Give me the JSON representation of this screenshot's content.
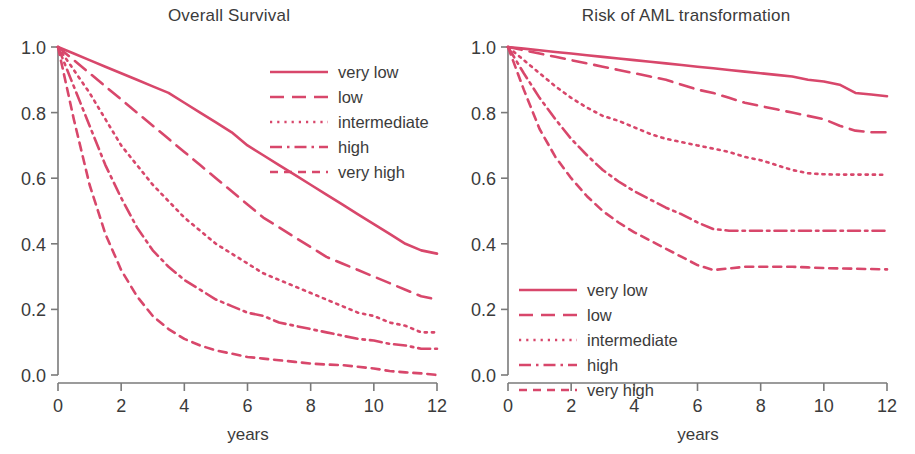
{
  "figure": {
    "width": 915,
    "height": 454,
    "background": "#ffffff",
    "line_color": "#d8476b",
    "axis_color": "#7a7a7a",
    "text_color": "#3b3b3b"
  },
  "panels": [
    {
      "id": "overall-survival",
      "title": "Overall Survival",
      "xlabel": "years",
      "ylabel": ""
    },
    {
      "id": "risk-aml-transformation",
      "title": "Risk of AML transformation",
      "xlabel": "years",
      "ylabel": ""
    }
  ],
  "axes": {
    "x_ticks": [
      "0",
      "2",
      "4",
      "6",
      "8",
      "10",
      "12"
    ],
    "y_ticks": [
      "0.0",
      "0.2",
      "0.4",
      "0.6",
      "0.8",
      "1.0"
    ],
    "xlim": [
      0,
      12
    ],
    "ylim": [
      0,
      1
    ]
  },
  "legend": {
    "entries": [
      {
        "label": "very low",
        "style": "solid"
      },
      {
        "label": "low",
        "style": "dashed"
      },
      {
        "label": "intermediate",
        "style": "dotted"
      },
      {
        "label": "high",
        "style": "dashdot"
      },
      {
        "label": "very high",
        "style": "shortdash"
      }
    ]
  },
  "chart_data": [
    {
      "type": "line",
      "title": "Overall Survival",
      "xlabel": "years",
      "ylabel": "",
      "xlim": [
        0,
        12
      ],
      "ylim": [
        0,
        1
      ],
      "grid": false,
      "legend_position": "top-right",
      "x": [
        0,
        0.5,
        1,
        1.5,
        2,
        2.5,
        3,
        3.5,
        4,
        4.5,
        5,
        5.5,
        6,
        6.5,
        7,
        7.5,
        8,
        8.5,
        9,
        9.5,
        10,
        10.5,
        11,
        11.5,
        12
      ],
      "series": [
        {
          "name": "very low",
          "style": "solid",
          "values": [
            1.0,
            0.98,
            0.96,
            0.94,
            0.92,
            0.9,
            0.88,
            0.86,
            0.83,
            0.8,
            0.77,
            0.74,
            0.7,
            0.67,
            0.64,
            0.61,
            0.58,
            0.55,
            0.52,
            0.49,
            0.46,
            0.43,
            0.4,
            0.38,
            0.37
          ]
        },
        {
          "name": "low",
          "style": "dashed",
          "values": [
            1.0,
            0.96,
            0.92,
            0.88,
            0.84,
            0.8,
            0.76,
            0.72,
            0.68,
            0.64,
            0.6,
            0.56,
            0.52,
            0.48,
            0.45,
            0.42,
            0.39,
            0.36,
            0.34,
            0.32,
            0.3,
            0.28,
            0.26,
            0.24,
            0.23
          ]
        },
        {
          "name": "intermediate",
          "style": "dotted",
          "values": [
            1.0,
            0.93,
            0.86,
            0.78,
            0.7,
            0.64,
            0.58,
            0.53,
            0.48,
            0.44,
            0.4,
            0.37,
            0.34,
            0.31,
            0.29,
            0.27,
            0.25,
            0.23,
            0.21,
            0.19,
            0.18,
            0.16,
            0.15,
            0.13,
            0.13
          ]
        },
        {
          "name": "high",
          "style": "dashdot",
          "values": [
            1.0,
            0.88,
            0.76,
            0.64,
            0.54,
            0.45,
            0.38,
            0.33,
            0.29,
            0.26,
            0.23,
            0.21,
            0.19,
            0.18,
            0.16,
            0.15,
            0.14,
            0.13,
            0.12,
            0.11,
            0.105,
            0.095,
            0.09,
            0.08,
            0.08
          ]
        },
        {
          "name": "very high",
          "style": "shortdash",
          "values": [
            1.0,
            0.78,
            0.58,
            0.43,
            0.32,
            0.24,
            0.18,
            0.14,
            0.11,
            0.09,
            0.075,
            0.065,
            0.055,
            0.05,
            0.045,
            0.04,
            0.035,
            0.032,
            0.03,
            0.025,
            0.02,
            0.012,
            0.008,
            0.005,
            0.0
          ]
        }
      ]
    },
    {
      "type": "line",
      "title": "Risk of AML transformation",
      "xlabel": "years",
      "ylabel": "",
      "xlim": [
        0,
        12
      ],
      "ylim": [
        0,
        1
      ],
      "grid": false,
      "legend_position": "bottom-left",
      "x": [
        0,
        0.5,
        1,
        1.5,
        2,
        2.5,
        3,
        3.5,
        4,
        4.5,
        5,
        5.5,
        6,
        6.5,
        7,
        7.5,
        8,
        8.5,
        9,
        9.5,
        10,
        10.5,
        11,
        11.5,
        12
      ],
      "series": [
        {
          "name": "very low",
          "style": "solid",
          "values": [
            1.0,
            0.995,
            0.99,
            0.985,
            0.98,
            0.975,
            0.97,
            0.965,
            0.96,
            0.955,
            0.95,
            0.945,
            0.94,
            0.935,
            0.93,
            0.925,
            0.92,
            0.915,
            0.91,
            0.9,
            0.895,
            0.885,
            0.86,
            0.855,
            0.85
          ]
        },
        {
          "name": "low",
          "style": "dashed",
          "values": [
            1.0,
            0.99,
            0.98,
            0.97,
            0.96,
            0.95,
            0.94,
            0.93,
            0.92,
            0.91,
            0.9,
            0.885,
            0.87,
            0.86,
            0.845,
            0.83,
            0.82,
            0.81,
            0.8,
            0.79,
            0.78,
            0.76,
            0.745,
            0.74,
            0.74
          ]
        },
        {
          "name": "intermediate",
          "style": "dotted",
          "values": [
            1.0,
            0.96,
            0.92,
            0.88,
            0.845,
            0.815,
            0.79,
            0.775,
            0.755,
            0.735,
            0.72,
            0.71,
            0.7,
            0.69,
            0.68,
            0.665,
            0.655,
            0.64,
            0.625,
            0.615,
            0.612,
            0.611,
            0.611,
            0.611,
            0.61
          ]
        },
        {
          "name": "high",
          "style": "dashdot",
          "values": [
            1.0,
            0.92,
            0.845,
            0.78,
            0.72,
            0.67,
            0.625,
            0.59,
            0.56,
            0.535,
            0.51,
            0.49,
            0.465,
            0.445,
            0.44,
            0.44,
            0.44,
            0.44,
            0.44,
            0.44,
            0.44,
            0.44,
            0.44,
            0.44,
            0.44
          ]
        },
        {
          "name": "very high",
          "style": "shortdash",
          "values": [
            1.0,
            0.87,
            0.75,
            0.665,
            0.6,
            0.545,
            0.5,
            0.465,
            0.435,
            0.41,
            0.385,
            0.36,
            0.335,
            0.32,
            0.325,
            0.33,
            0.33,
            0.33,
            0.33,
            0.328,
            0.326,
            0.325,
            0.324,
            0.323,
            0.322
          ]
        }
      ]
    }
  ]
}
